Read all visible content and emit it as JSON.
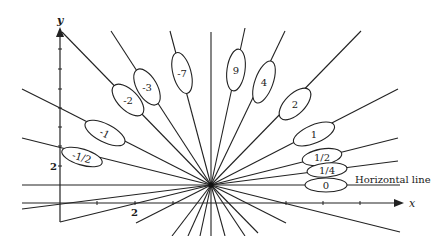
{
  "figure": {
    "axes": {
      "x_label": "x",
      "y_label": "y",
      "x_tick_label": "2",
      "y_tick_label": "2"
    },
    "center": {
      "px": 211,
      "py": 185
    },
    "annotation": "Horizontal line",
    "slope_labels": [
      {
        "label": "-1/2",
        "cx": 82,
        "cy": 157,
        "rx": 21,
        "ry": 8,
        "angle": 17
      },
      {
        "label": "-1",
        "cx": 105,
        "cy": 133,
        "rx": 22,
        "ry": 9,
        "angle": 27
      },
      {
        "label": "-2",
        "cx": 128,
        "cy": 100,
        "rx": 20,
        "ry": 10,
        "angle": 45
      },
      {
        "label": "-3",
        "cx": 147,
        "cy": 87,
        "rx": 20,
        "ry": 10,
        "angle": 60
      },
      {
        "label": "-7",
        "cx": 182,
        "cy": 73,
        "rx": 21,
        "ry": 9,
        "angle": 75
      },
      {
        "label": "9",
        "cx": 236,
        "cy": 70,
        "rx": 21,
        "ry": 9,
        "angle": -82
      },
      {
        "label": "4",
        "cx": 264,
        "cy": 82,
        "rx": 22,
        "ry": 9,
        "angle": -70
      },
      {
        "label": "2",
        "cx": 295,
        "cy": 104,
        "rx": 20,
        "ry": 10,
        "angle": -45
      },
      {
        "label": "1",
        "cx": 314,
        "cy": 134,
        "rx": 22,
        "ry": 9,
        "angle": -23
      },
      {
        "label": "1/2",
        "cx": 322,
        "cy": 157,
        "rx": 20,
        "ry": 8,
        "angle": -10
      },
      {
        "label": "1/4",
        "cx": 327,
        "cy": 170,
        "rx": 20,
        "ry": 7,
        "angle": -5
      },
      {
        "label": "0",
        "cx": 326,
        "cy": 185,
        "rx": 21,
        "ry": 7,
        "angle": 0
      }
    ]
  }
}
